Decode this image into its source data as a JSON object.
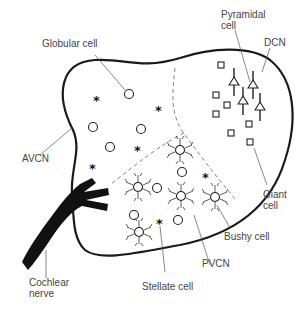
{
  "diagram": {
    "labels": {
      "globular_cell": "Globular cell",
      "pyramidal_cell_1": "Pyramidal",
      "pyramidal_cell_2": "cell",
      "dcn": "DCN",
      "avcn": "AVCN",
      "giant_cell_1": "Giant",
      "giant_cell_2": "cell",
      "bushy_cell": "Bushy cell",
      "pvcn": "PVCN",
      "cochlear_nerve_1": "Cochlear",
      "cochlear_nerve_2": "nerve",
      "stellate_cell": "Stellate cell"
    },
    "regions": [
      "AVCN",
      "PVCN",
      "DCN"
    ],
    "cell_types": [
      "Globular cell",
      "Pyramidal cell",
      "Giant cell",
      "Bushy cell",
      "Stellate cell"
    ],
    "star_glyph": "*"
  }
}
